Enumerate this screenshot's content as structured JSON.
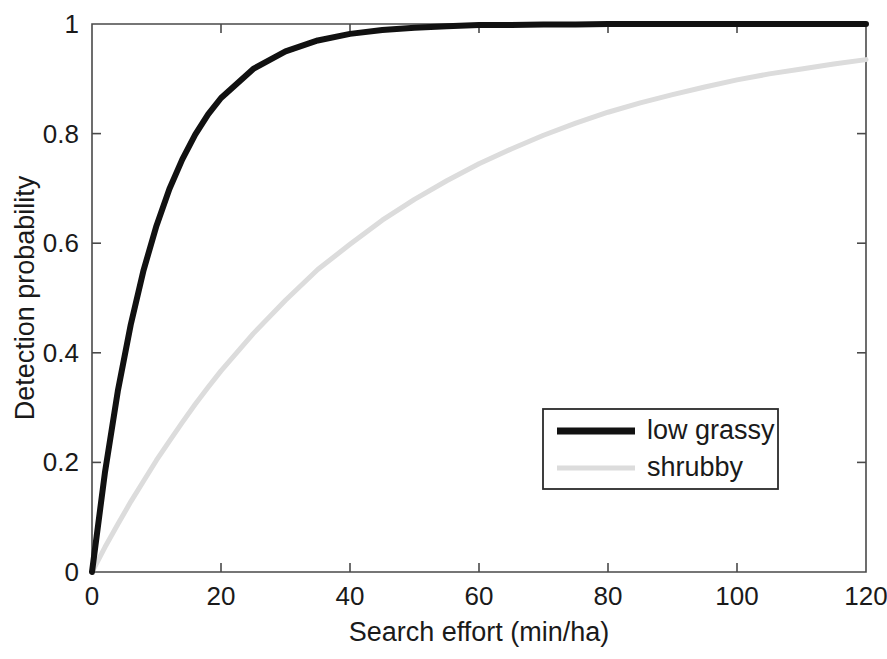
{
  "chart_data": {
    "type": "line",
    "title": "",
    "xlabel": "Search effort (min/ha)",
    "ylabel": "Detection probability",
    "xlim": [
      0,
      120
    ],
    "ylim": [
      0,
      1
    ],
    "xticks": [
      0,
      20,
      40,
      60,
      80,
      100,
      120
    ],
    "xtick_labels": [
      "0",
      "20",
      "40",
      "60",
      "80",
      "100",
      "120"
    ],
    "yticks": [
      0,
      0.2,
      0.4,
      0.6,
      0.8,
      1
    ],
    "ytick_labels": [
      "0",
      "0.2",
      "0.4",
      "0.6",
      "0.8",
      "1"
    ],
    "grid": false,
    "legend_position": "lower right",
    "x": [
      0,
      2,
      4,
      6,
      8,
      10,
      12,
      14,
      16,
      18,
      20,
      25,
      30,
      35,
      40,
      45,
      50,
      55,
      60,
      65,
      70,
      75,
      80,
      85,
      90,
      95,
      100,
      105,
      110,
      115,
      120
    ],
    "series": [
      {
        "name": "low grassy",
        "color": "#111111",
        "line_width": 6,
        "model": "1 - exp(-0.1 * x)",
        "values": [
          0.0,
          0.181,
          0.33,
          0.451,
          0.551,
          0.632,
          0.699,
          0.753,
          0.798,
          0.835,
          0.865,
          0.918,
          0.95,
          0.97,
          0.982,
          0.989,
          0.993,
          0.996,
          0.998,
          0.998,
          0.999,
          0.999,
          1.0,
          1.0,
          1.0,
          1.0,
          1.0,
          1.0,
          1.0,
          1.0,
          1.0
        ]
      },
      {
        "name": "shrubby",
        "color": "#dcdcdc",
        "line_width": 5,
        "model": "1 - exp(-0.0228 * x)",
        "values": [
          0.0,
          0.045,
          0.087,
          0.128,
          0.166,
          0.204,
          0.239,
          0.273,
          0.306,
          0.337,
          0.367,
          0.435,
          0.496,
          0.552,
          0.598,
          0.642,
          0.68,
          0.714,
          0.745,
          0.772,
          0.797,
          0.819,
          0.839,
          0.856,
          0.871,
          0.885,
          0.898,
          0.909,
          0.918,
          0.927,
          0.935
        ]
      }
    ],
    "legend_entries": [
      {
        "label": "low grassy",
        "color": "#111111",
        "line_width": 7
      },
      {
        "label": "shrubby",
        "color": "#dcdcdc",
        "line_width": 5
      }
    ]
  },
  "figure": {
    "background": "#ffffff",
    "axis_color": "#4a4a4a",
    "text_color": "#1a1a1a"
  }
}
